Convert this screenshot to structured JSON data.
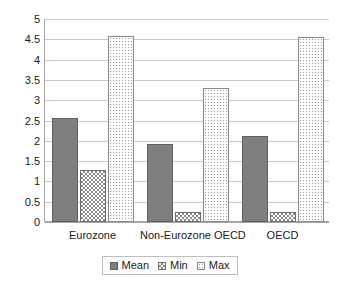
{
  "chart_data": {
    "type": "bar",
    "title": "",
    "subtitle": "",
    "xlabel": "",
    "ylabel": "",
    "categories": [
      "Eurozone",
      "Non-Eurozone OECD",
      "OECD"
    ],
    "series": [
      {
        "name": "Mean",
        "values": [
          2.55,
          1.91,
          2.12
        ],
        "color": "#7f7f7f",
        "pattern": "solid"
      },
      {
        "name": "Min",
        "values": [
          1.27,
          0.25,
          0.25
        ],
        "color": "#8a8a8a",
        "pattern": "checkerboard"
      },
      {
        "name": "Max",
        "values": [
          4.58,
          3.3,
          4.56
        ],
        "color": "#9a9a9a",
        "pattern": "dotted"
      }
    ],
    "ylim": [
      0,
      5
    ],
    "ytick_step": 0.5,
    "ytick_labels": [
      "5",
      "4.5",
      "4",
      "3.5",
      "3",
      "2.5",
      "2",
      "1.5",
      "1",
      "0.5",
      "0"
    ],
    "grid": true,
    "grid_axis": "y",
    "legend_position": "bottom",
    "plot_background": "#ffffff",
    "gridline_color": "#c9c9c9",
    "axis_color": "#a6a6a6"
  },
  "legend": {
    "entries": [
      {
        "label": "Mean"
      },
      {
        "label": "Min"
      },
      {
        "label": "Max"
      }
    ]
  }
}
